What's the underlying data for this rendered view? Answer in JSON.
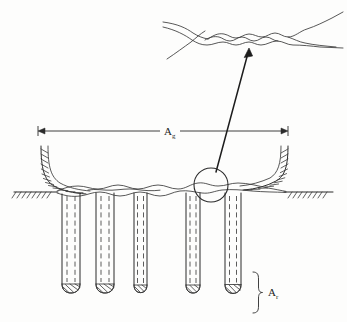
{
  "figure": {
    "background_color": "#fdfdfc",
    "ink_color": "#2b2b2b"
  },
  "labels": {
    "gross_area": {
      "symbol": "A",
      "subscript": "g",
      "full": "Ag"
    },
    "pile_area": {
      "symbol": "A",
      "subscript": "r",
      "full": "Ar"
    }
  },
  "dimension": {
    "name": "gross-width-dimension",
    "x_start": 38,
    "x_end": 288,
    "y": 131,
    "label_x": 168,
    "label_y": 134
  },
  "ground": {
    "name": "ground-surface",
    "y": 192,
    "left_hatch_x": [
      14,
      48
    ],
    "right_hatch_x": [
      290,
      330
    ]
  },
  "callout": {
    "name": "detail-callout-circle",
    "cx": 211,
    "cy": 185,
    "r": 17,
    "arrow_from": [
      216,
      171
    ],
    "arrow_to": [
      249,
      49
    ]
  },
  "detail_inset": {
    "name": "magnified-roughness-detail",
    "x_range": [
      163,
      343
    ],
    "y_range": [
      8,
      60
    ]
  },
  "piles": [
    {
      "name": "pile-1",
      "x_center": 71,
      "width": 18,
      "top_y": 193,
      "bottom_y": 291
    },
    {
      "name": "pile-2",
      "x_center": 105,
      "width": 18,
      "top_y": 193,
      "bottom_y": 291
    },
    {
      "name": "pile-3",
      "x_center": 140,
      "width": 13,
      "top_y": 193,
      "bottom_y": 291
    },
    {
      "name": "pile-4",
      "x_center": 193,
      "width": 14,
      "top_y": 193,
      "bottom_y": 291
    },
    {
      "name": "pile-5",
      "x_center": 233,
      "width": 16,
      "top_y": 193,
      "bottom_y": 291
    }
  ],
  "brace": {
    "name": "pile-area-brace",
    "x": 258,
    "y_top": 272,
    "y_bottom": 312,
    "label_x": 274,
    "label_y": 293
  }
}
